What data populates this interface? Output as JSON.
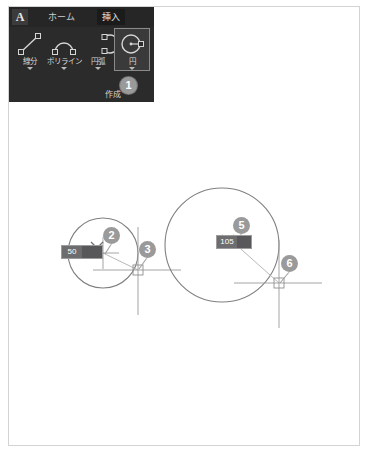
{
  "app": {
    "logo_glyph": "A",
    "logo_name": "autocad-logo"
  },
  "ribbon": {
    "tabs": [
      {
        "label": "ホーム",
        "name": "tab-home",
        "active": false
      },
      {
        "label": "挿入",
        "name": "tab-insert",
        "active": true
      }
    ],
    "panel_name": "作成",
    "tools": [
      {
        "label": "線分",
        "icon": "line-icon",
        "selected": false
      },
      {
        "label": "ポリライン",
        "icon": "polyline-icon",
        "selected": false
      },
      {
        "label": "円弧",
        "icon": "arc-icon",
        "selected": false
      },
      {
        "label": "円",
        "icon": "circle-icon",
        "selected": true
      }
    ]
  },
  "badges": [
    {
      "number": "1",
      "name": "annotation-badge-1",
      "x": 120,
      "y": 77
    },
    {
      "number": "2",
      "name": "annotation-badge-2",
      "x": 103,
      "y": 227
    },
    {
      "number": "3",
      "name": "annotation-badge-3",
      "x": 139,
      "y": 241
    },
    {
      "number": "5",
      "name": "annotation-badge-5",
      "x": 233,
      "y": 217
    },
    {
      "number": "6",
      "name": "annotation-badge-6",
      "x": 281,
      "y": 255
    }
  ],
  "drawing": {
    "small_circle": {
      "radius_input_value": "50",
      "center_x": 103,
      "center_y": 150,
      "radius": 35
    },
    "large_circle": {
      "radius_input_value": "105",
      "center_x": 222,
      "center_y": 145,
      "radius": 57
    }
  }
}
